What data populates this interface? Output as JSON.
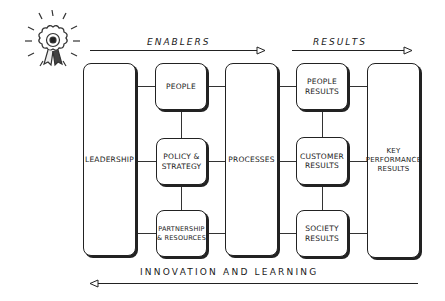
{
  "diagram": {
    "top_arrows": [
      {
        "label": "ENABLERS",
        "direction": "right"
      },
      {
        "label": "RESULTS",
        "direction": "right"
      }
    ],
    "bottom_arrow": {
      "label": "INNOVATION AND LEARNING",
      "direction": "left"
    },
    "boxes": {
      "leadership": "LEADERSHIP",
      "people": "PEOPLE",
      "policy_strategy": "POLICY &\nSTRATEGY",
      "partnership_resources": "PARTNERSHIP\n& RESOURCES",
      "processes": "PROCESSES",
      "people_results": "PEOPLE\nRESULTS",
      "customer_results": "CUSTOMER\nRESULTS",
      "society_results": "SOCIETY\nRESULTS",
      "key_performance_results": "KEY\nPERFORMANCE\nRESULTS"
    },
    "icon": "award-rosette-icon"
  }
}
